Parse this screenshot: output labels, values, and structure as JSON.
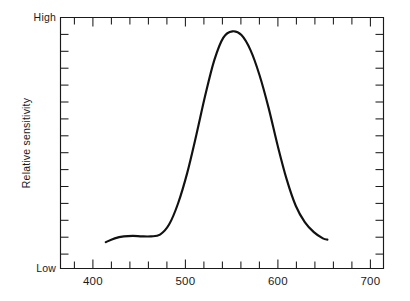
{
  "chart_data": {
    "type": "line",
    "title": "",
    "subtitle": "",
    "xlabel": "",
    "ylabel": "Relative sensitivity",
    "xlim": [
      365,
      722
    ],
    "ylim": [
      0,
      1
    ],
    "grid": false,
    "legend": null,
    "x_tick_labels": [
      "400",
      "500",
      "600",
      "700"
    ],
    "x_tick_values": [
      400,
      500,
      600,
      700
    ],
    "x_minor_tick_interval": 20,
    "y_tick_labels": [
      "Low",
      "High"
    ],
    "y_tick_values": [
      0,
      1
    ],
    "y_minor_tick_count": 14,
    "axis_color": "#1a1a1a",
    "curve_color": "#111111",
    "background": "#ffffff",
    "series": [
      {
        "name": "Relative sensitivity",
        "x": [
          415,
          425,
          435,
          445,
          455,
          465,
          475,
          485,
          495,
          505,
          515,
          525,
          535,
          545,
          555,
          565,
          575,
          585,
          595,
          605,
          615,
          625,
          635,
          645,
          655,
          660
        ],
        "values": [
          0.105,
          0.12,
          0.128,
          0.13,
          0.128,
          0.128,
          0.135,
          0.175,
          0.26,
          0.38,
          0.53,
          0.69,
          0.83,
          0.92,
          0.945,
          0.93,
          0.87,
          0.77,
          0.64,
          0.49,
          0.355,
          0.25,
          0.185,
          0.145,
          0.12,
          0.115
        ]
      }
    ]
  },
  "labels": {
    "y_axis_title": "Relative sensitivity",
    "y_high": "High",
    "y_low": "Low",
    "x_400": "400",
    "x_500": "500",
    "x_600": "600",
    "x_700": "700"
  }
}
